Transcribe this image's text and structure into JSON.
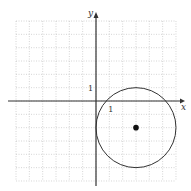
{
  "chart_data": {
    "type": "scatter",
    "title": "",
    "xlabel": "x",
    "ylabel": "y",
    "xlim": [
      -6,
      6
    ],
    "ylim": [
      -6,
      6
    ],
    "grid": true,
    "tick_labels": {
      "x_unit": "1",
      "y_unit": "1"
    },
    "shapes": [
      {
        "kind": "circle",
        "center": [
          3,
          -2
        ],
        "radius": 3,
        "equation": "(x-3)^2 + (y+2)^2 = 9"
      }
    ],
    "points": [
      {
        "x": 3,
        "y": -2,
        "label": "center"
      }
    ]
  },
  "axes": {
    "x_label": "x",
    "y_label": "y",
    "x_tick": "1",
    "y_tick": "1"
  },
  "colors": {
    "grid": "#b8b8b8",
    "axis": "#333333",
    "curve": "#333333",
    "point": "#111111"
  }
}
